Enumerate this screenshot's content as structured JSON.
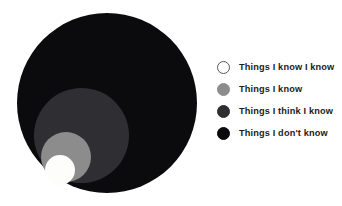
{
  "chart_data": {
    "type": "pie",
    "title": "",
    "subtitle": "",
    "xlabel": "",
    "ylabel": "",
    "legend_position": "right",
    "grid": false,
    "categories": [
      "Things I know I know",
      "Things I know",
      "Things I think I know",
      "Things I don't know"
    ],
    "values": [
      30,
      50,
      95,
      180
    ],
    "value_unit": "circle diameter in px",
    "colors": [
      "#fdfdfb",
      "#8c8c8c",
      "#2f2f33",
      "#0b0b0d"
    ],
    "circles": [
      {
        "label": "Things I don't know",
        "color": "#0b0b0d",
        "cx": 107,
        "cy": 103,
        "diameter": 180,
        "z": 1
      },
      {
        "label": "Things I think I know",
        "color": "#2f2f33",
        "cx": 81,
        "cy": 135,
        "diameter": 95,
        "z": 2
      },
      {
        "label": "Things I know",
        "color": "#8c8c8c",
        "cx": 66,
        "cy": 157,
        "diameter": 50,
        "z": 3
      },
      {
        "label": "Things I know I know",
        "color": "#fdfdfb",
        "cx": 60,
        "cy": 170,
        "diameter": 30,
        "z": 4
      }
    ]
  },
  "legend": {
    "items": [
      {
        "label": "Things I know I know",
        "color": "#ffffff",
        "border": "#575757",
        "swatch_name": "swatch-things-i-know-i-know"
      },
      {
        "label": "Things I know",
        "color": "#8c8c8c",
        "border": "#8c8c8c",
        "swatch_name": "swatch-things-i-know"
      },
      {
        "label": "Things I think I know",
        "color": "#2f2f33",
        "border": "#2f2f33",
        "swatch_name": "swatch-things-i-think-i-know"
      },
      {
        "label": "Things I don't know",
        "color": "#0b0b0d",
        "border": "#0b0b0d",
        "swatch_name": "swatch-things-i-dont-know"
      }
    ]
  },
  "theme": {
    "background": "#ffffff",
    "text_color": "#1c1c22"
  }
}
